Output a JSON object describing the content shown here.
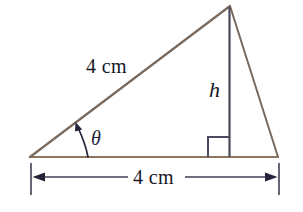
{
  "figure": {
    "background_color": "#ffffff",
    "side_color": "#8a7560",
    "hypotenuse_color": "#7a6a5e",
    "altitude_color": "#3f3f52",
    "dimension_color": "#3f3f52",
    "text_color": "#17171f"
  },
  "labels": {
    "hypotenuse": "4 cm",
    "base": "4 cm",
    "height": "h",
    "angle": "θ"
  },
  "geometry": {
    "left_vertex": [
      30,
      157
    ],
    "apex": [
      230,
      6
    ],
    "right_vertex": [
      278,
      157
    ],
    "altitude_foot": [
      229,
      157
    ],
    "right_angle_size": 21,
    "dimension_line_y": 177,
    "dimension_left_x": 33,
    "dimension_right_x": 277,
    "extension_tick_top": 163,
    "extension_tick_bottom": 195
  }
}
